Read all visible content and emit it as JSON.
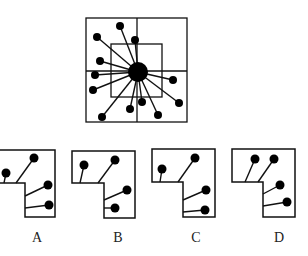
{
  "figure": {
    "question_figure": {
      "outer_square": {
        "x": 86,
        "y": 18,
        "w": 101,
        "h": 104
      },
      "inner_square": {
        "x": 111,
        "y": 44,
        "w": 51,
        "h": 53
      },
      "divider_v_x": 137,
      "divider_h_y": 71,
      "hub": {
        "cx": 138,
        "cy": 72,
        "r": 10
      },
      "dots": [
        {
          "x": 120,
          "y": 26
        },
        {
          "x": 97,
          "y": 37
        },
        {
          "x": 135,
          "y": 40
        },
        {
          "x": 100,
          "y": 61
        },
        {
          "x": 95,
          "y": 75
        },
        {
          "x": 93,
          "y": 90
        },
        {
          "x": 102,
          "y": 117
        },
        {
          "x": 130,
          "y": 109
        },
        {
          "x": 142,
          "y": 102
        },
        {
          "x": 158,
          "y": 115
        },
        {
          "x": 179,
          "y": 103
        },
        {
          "x": 173,
          "y": 80
        }
      ],
      "dot_radius": 4
    },
    "options": [
      {
        "label": "A",
        "label_x": 37,
        "shape": [
          [
            -6,
            150
          ],
          [
            55,
            150
          ],
          [
            55,
            217
          ],
          [
            25,
            217
          ],
          [
            25,
            183
          ],
          [
            -6,
            183
          ]
        ],
        "sticks": [
          {
            "x1": 4,
            "y1": 183,
            "x2": 6,
            "y2": 173
          },
          {
            "x1": 16,
            "y1": 183,
            "x2": 34,
            "y2": 158
          },
          {
            "x1": 25,
            "y1": 196,
            "x2": 48,
            "y2": 185
          },
          {
            "x1": 25,
            "y1": 208,
            "x2": 49,
            "y2": 205
          }
        ]
      },
      {
        "label": "B",
        "label_x": 118,
        "shape": [
          [
            72,
            151
          ],
          [
            135,
            151
          ],
          [
            135,
            218
          ],
          [
            104,
            218
          ],
          [
            104,
            183
          ],
          [
            72,
            183
          ]
        ],
        "sticks": [
          {
            "x1": 80,
            "y1": 183,
            "x2": 84,
            "y2": 165
          },
          {
            "x1": 98,
            "y1": 183,
            "x2": 115,
            "y2": 160
          },
          {
            "x1": 104,
            "y1": 200,
            "x2": 127,
            "y2": 190
          },
          {
            "x1": 104,
            "y1": 208,
            "x2": 115,
            "y2": 208
          }
        ]
      },
      {
        "label": "C",
        "label_x": 196,
        "shape": [
          [
            152,
            149
          ],
          [
            215,
            149
          ],
          [
            215,
            217
          ],
          [
            183,
            217
          ],
          [
            183,
            182
          ],
          [
            152,
            182
          ]
        ],
        "sticks": [
          {
            "x1": 160,
            "y1": 182,
            "x2": 162,
            "y2": 169
          },
          {
            "x1": 178,
            "y1": 182,
            "x2": 195,
            "y2": 158
          },
          {
            "x1": 183,
            "y1": 200,
            "x2": 206,
            "y2": 190
          },
          {
            "x1": 183,
            "y1": 212,
            "x2": 205,
            "y2": 210
          }
        ]
      },
      {
        "label": "D",
        "label_x": 279,
        "shape": [
          [
            232,
            149
          ],
          [
            295,
            149
          ],
          [
            295,
            217
          ],
          [
            263,
            217
          ],
          [
            263,
            182
          ],
          [
            232,
            182
          ]
        ],
        "sticks": [
          {
            "x1": 245,
            "y1": 182,
            "x2": 255,
            "y2": 159
          },
          {
            "x1": 258,
            "y1": 182,
            "x2": 274,
            "y2": 159
          },
          {
            "x1": 263,
            "y1": 194,
            "x2": 280,
            "y2": 185
          },
          {
            "x1": 263,
            "y1": 206,
            "x2": 287,
            "y2": 202
          }
        ]
      }
    ],
    "colors": {
      "stroke": "#111111",
      "fill": "#000000",
      "background": "#ffffff",
      "label": "#222222"
    }
  }
}
